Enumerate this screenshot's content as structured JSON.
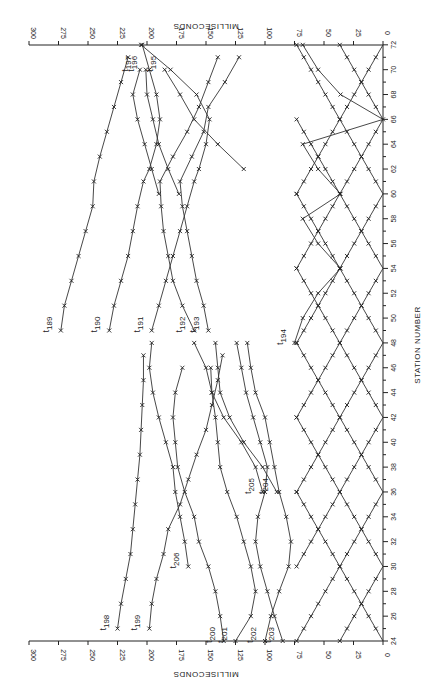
{
  "chart_data": {
    "type": "line",
    "orientation": "rotated-90",
    "title": "",
    "xlabel": "STATION NUMBER",
    "ylabel": "MILLISECONDS",
    "xlim": [
      24,
      72
    ],
    "ylim": [
      0,
      300
    ],
    "x_ticks": [
      24,
      26,
      28,
      30,
      32,
      34,
      36,
      38,
      40,
      42,
      44,
      46,
      48,
      50,
      52,
      54,
      56,
      58,
      60,
      62,
      64,
      66,
      68,
      70,
      72
    ],
    "y_ticks": [
      0,
      25,
      50,
      75,
      100,
      125,
      150,
      175,
      200,
      225,
      250,
      275,
      300
    ],
    "grid": false,
    "legend": "inline labels",
    "shot_points": [
      24,
      30,
      36,
      42,
      48,
      54,
      60,
      66,
      72
    ],
    "series": [
      {
        "name": "t189",
        "label": "t",
        "sub": "189",
        "x": [
          49,
          51,
          53,
          55,
          57,
          59,
          61,
          63,
          65,
          67,
          69,
          71
        ],
        "values": [
          273,
          270,
          264,
          258,
          252,
          246,
          245,
          240,
          234,
          228,
          222,
          216
        ]
      },
      {
        "name": "t190",
        "label": "t",
        "sub": "190",
        "x": [
          49,
          51,
          53,
          55,
          57,
          59,
          61,
          62,
          64,
          66,
          68,
          70,
          72
        ],
        "values": [
          232,
          228,
          222,
          216,
          212,
          208,
          203,
          198,
          192,
          189,
          192,
          198,
          204
        ]
      },
      {
        "name": "t191",
        "label": "t",
        "sub": "191",
        "x": [
          49,
          51,
          53,
          55,
          57,
          59,
          61,
          62,
          64,
          66,
          68,
          70,
          72
        ],
        "values": [
          196,
          190,
          184,
          178,
          172,
          166,
          160,
          156,
          150,
          147,
          158,
          180,
          205
        ]
      },
      {
        "name": "t192",
        "label": "t",
        "sub": "192",
        "x": [
          49,
          51,
          53,
          55,
          57,
          59,
          61,
          63,
          65,
          67,
          69,
          71
        ],
        "values": [
          160,
          170,
          178,
          182,
          186,
          188,
          189,
          178,
          166,
          156,
          148,
          140
        ]
      },
      {
        "name": "t193",
        "label": "t",
        "sub": "193",
        "x": [
          49,
          51,
          53,
          55,
          57,
          59,
          61,
          63,
          65,
          67,
          69,
          71
        ],
        "values": [
          148,
          152,
          158,
          162,
          166,
          170,
          172,
          162,
          152,
          148,
          134,
          122
        ]
      },
      {
        "name": "t194",
        "label": "t",
        "sub": "194",
        "x": [
          48,
          50,
          52,
          54,
          56,
          58,
          60,
          62,
          64,
          66,
          68,
          70,
          72
        ],
        "values": [
          75,
          68,
          55,
          36,
          55,
          68,
          36,
          55,
          68,
          0,
          36,
          55,
          68
        ]
      },
      {
        "name": "t195",
        "label": "t",
        "sub": "195",
        "x": [
          70,
          68,
          66,
          64,
          62
        ],
        "values": [
          185,
          172,
          160,
          140,
          118
        ]
      },
      {
        "name": "t196",
        "label": "t",
        "sub": "196",
        "x": [
          70,
          68,
          66,
          64,
          62,
          60
        ],
        "values": [
          201,
          200,
          195,
          190,
          182,
          173
        ]
      },
      {
        "name": "t197",
        "label": "t",
        "sub": "197",
        "x": [
          70,
          68,
          66,
          64,
          62,
          60
        ],
        "values": [
          206,
          212,
          208,
          202,
          196,
          190
        ]
      },
      {
        "name": "t198",
        "label": "t",
        "sub": "198",
        "x": [
          25,
          27,
          29,
          31,
          33,
          35,
          37,
          39,
          41,
          43,
          45,
          47
        ],
        "values": [
          225,
          222,
          218,
          214,
          212,
          210,
          208,
          206,
          205,
          204,
          203,
          203
        ]
      },
      {
        "name": "t199",
        "label": "t",
        "sub": "199",
        "x": [
          25,
          27,
          29,
          31,
          33,
          35,
          37,
          39,
          41,
          43,
          45,
          47
        ],
        "values": [
          198,
          196,
          192,
          186,
          182,
          172,
          165,
          158,
          150,
          145,
          140,
          136
        ]
      },
      {
        "name": "t200",
        "label": "t",
        "sub": "200",
        "x": [
          24,
          26,
          28,
          30,
          32,
          34,
          36,
          38,
          40,
          42,
          44,
          46
        ],
        "values": [
          135,
          138,
          142,
          148,
          156,
          160,
          168,
          174,
          176,
          178,
          176,
          170
        ]
      },
      {
        "name": "t201",
        "label": "t",
        "sub": "201",
        "x": [
          24,
          26,
          28,
          30,
          32,
          34,
          36,
          38,
          40,
          42,
          44,
          46
        ],
        "values": [
          125,
          112,
          108,
          112,
          118,
          124,
          132,
          138,
          140,
          142,
          145,
          146
        ]
      },
      {
        "name": "t202",
        "label": "t",
        "sub": "202",
        "x": [
          24,
          26,
          28,
          30,
          32,
          34,
          36,
          38,
          40,
          42,
          44,
          46,
          48
        ],
        "values": [
          100,
          95,
          88,
          80,
          78,
          82,
          88,
          92,
          96,
          100,
          108,
          112,
          115
        ]
      },
      {
        "name": "t203",
        "label": "t",
        "sub": "203",
        "x": [
          24,
          26,
          28,
          30,
          32,
          34,
          36,
          38,
          40,
          42,
          44,
          46,
          48
        ],
        "values": [
          85,
          92,
          98,
          104,
          108,
          106,
          100,
          98,
          104,
          110,
          116,
          120,
          124
        ]
      },
      {
        "name": "t204",
        "label": "t",
        "sub": "204",
        "x": [
          36,
          38,
          40,
          42,
          44,
          46,
          48
        ],
        "values": [
          90,
          102,
          118,
          130,
          138,
          140,
          142
        ]
      },
      {
        "name": "t205",
        "label": "t",
        "sub": "205",
        "x": [
          36,
          38,
          40,
          42,
          44,
          46,
          48
        ],
        "values": [
          102,
          108,
          120,
          135,
          145,
          150,
          160
        ]
      },
      {
        "name": "t206",
        "label": "t",
        "sub": "206",
        "x": [
          30,
          32,
          34,
          36,
          38,
          40,
          42,
          44,
          46,
          48
        ],
        "values": [
          165,
          168,
          172,
          176,
          178,
          184,
          190,
          195,
          198,
          196
        ]
      }
    ],
    "direct_arrivals": {
      "note": "V-shaped direct-wave curves from each shot point with zero time at shot station",
      "slope_ms_per_station": 6.1,
      "max_ms": 75
    }
  },
  "axes": {
    "ms_label_top": "MILLISECONDS",
    "ms_label_bottom": "MILLISECONDS",
    "station_label": "STATION NUMBER"
  }
}
